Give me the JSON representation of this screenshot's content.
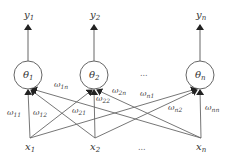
{
  "diagram": {
    "type": "single-layer neural network",
    "colors": {
      "line": "#666666",
      "text": "#333333",
      "background": "#ffffff"
    },
    "outputs": [
      {
        "id": "y1",
        "base": "y",
        "sub": "1"
      },
      {
        "id": "y2",
        "base": "y",
        "sub": "2"
      },
      {
        "id": "yn",
        "base": "y",
        "sub": "n"
      }
    ],
    "neurons": [
      {
        "id": "theta1",
        "base": "θ",
        "sub": "1"
      },
      {
        "id": "theta2",
        "base": "θ",
        "sub": "2"
      },
      {
        "id": "thetan",
        "base": "θ",
        "sub": "n"
      }
    ],
    "inputs": [
      {
        "id": "x1",
        "base": "x",
        "sub": "1"
      },
      {
        "id": "x2",
        "base": "x",
        "sub": "2"
      },
      {
        "id": "xn",
        "base": "x",
        "sub": "n"
      }
    ],
    "weights": [
      {
        "id": "w11",
        "base": "ω",
        "sub": "11"
      },
      {
        "id": "w12",
        "base": "ω",
        "sub": "12"
      },
      {
        "id": "w1n",
        "base": "ω",
        "sub": "1n"
      },
      {
        "id": "w21",
        "base": "ω",
        "sub": "21"
      },
      {
        "id": "w22",
        "base": "ω",
        "sub": "22"
      },
      {
        "id": "w2n",
        "base": "ω",
        "sub": "2n"
      },
      {
        "id": "wn1",
        "base": "ω",
        "sub": "n1"
      },
      {
        "id": "wn2",
        "base": "ω",
        "sub": "n2"
      },
      {
        "id": "wnn",
        "base": "ω",
        "sub": "nn"
      }
    ],
    "ellipsis": {
      "neurons": "...",
      "inputs": "..."
    }
  }
}
